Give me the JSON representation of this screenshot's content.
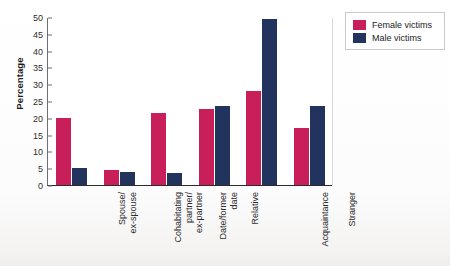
{
  "chart_data": {
    "type": "bar",
    "title": "",
    "xlabel": "",
    "ylabel": "Percentage",
    "ylim": [
      0,
      50
    ],
    "yticks": [
      0,
      5,
      10,
      15,
      20,
      25,
      30,
      35,
      40,
      45,
      50
    ],
    "grid": false,
    "legend_position": "top-right",
    "categories": [
      "Spouse/\nex-spouse",
      "Cohabitating\npartner/\nex-partner",
      "Date/former\ndate",
      "Relative",
      "Acquaintance",
      "Stranger"
    ],
    "series": [
      {
        "name": "Female victims",
        "color": "#c81e5a",
        "values": [
          20,
          4.5,
          21.5,
          22.5,
          28,
          17
        ]
      },
      {
        "name": "Male victims",
        "color": "#22335e",
        "values": [
          5,
          4,
          3.5,
          23.5,
          49.5,
          23.5
        ]
      }
    ]
  },
  "axis": {
    "y_title": "Percentage",
    "y_tick_labels": [
      "50",
      "45",
      "40",
      "35",
      "30",
      "25",
      "20",
      "15",
      "10",
      "5",
      "0"
    ]
  },
  "categories_display": [
    {
      "lines": [
        "Spouse/",
        "ex-spouse"
      ]
    },
    {
      "lines": [
        "Cohabitating",
        "partner/",
        "ex-partner"
      ]
    },
    {
      "lines": [
        "Date/former",
        "date"
      ]
    },
    {
      "lines": [
        "Relative"
      ]
    },
    {
      "lines": [
        "Acquaintance"
      ]
    },
    {
      "lines": [
        "Stranger"
      ]
    }
  ],
  "legend": {
    "items": [
      {
        "label": "Female victims",
        "color": "#c81e5a"
      },
      {
        "label": "Male victims",
        "color": "#22335e"
      }
    ]
  },
  "caption": {
    "text": ""
  },
  "colors": {
    "female": "#c81e5a",
    "male": "#22335e",
    "axis": "#2b2b2b",
    "background": "#ffffff"
  }
}
